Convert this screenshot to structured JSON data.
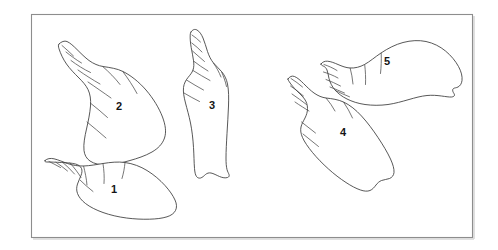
{
  "figure": {
    "kind": "scientific-line-drawing",
    "background_color": "#ffffff",
    "frame": {
      "stroke_color": "#8d8d8d",
      "shadow_color": "#d8d8d8",
      "x": 31,
      "y": 14,
      "width": 441,
      "height": 223
    },
    "ink_color": "#3a3a3a",
    "label_color": "#151515"
  },
  "specimens": [
    {
      "id": "shell-1",
      "label": "1",
      "label_x": 114,
      "label_y": 190,
      "orientation": "apex-upper-left, aperture-lower-right",
      "description": "elongate spired shell lying near lower-left of plate"
    },
    {
      "id": "shell-2",
      "label": "2",
      "label_x": 119,
      "label_y": 107,
      "orientation": "apex-upper-left, aperture-lower-right",
      "description": "large fusiform shell with tall spire, upper-left of plate"
    },
    {
      "id": "shell-3",
      "label": "3",
      "label_x": 212,
      "label_y": 106,
      "orientation": "apex-up, aperture-down",
      "description": "narrow upright shell at centre of plate"
    },
    {
      "id": "shell-4",
      "label": "4",
      "label_x": 343,
      "label_y": 133,
      "orientation": "apex-upper-left, aperture-lower-right",
      "description": "broad shell with short spire, right-centre of plate"
    },
    {
      "id": "shell-5",
      "label": "5",
      "label_x": 387,
      "label_y": 62,
      "orientation": "apex-left, aperture-right",
      "description": "wide ovate shell lying horizontally, upper-right of plate"
    }
  ]
}
